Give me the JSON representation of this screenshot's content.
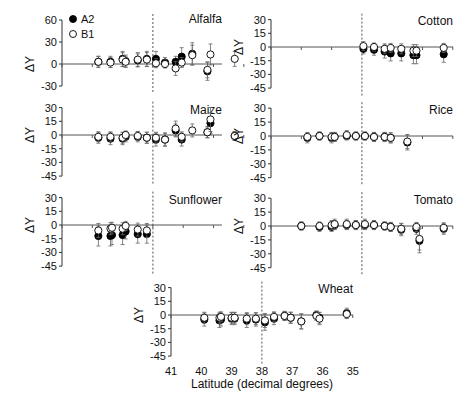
{
  "figure": {
    "xlabel": "Latitude (decimal degrees)",
    "ylabel": "ΔY",
    "x_ticks": [
      "41",
      "40",
      "39",
      "38",
      "37",
      "36",
      "35"
    ],
    "legend": [
      {
        "label": "A2",
        "marker": "filled-circle",
        "color": "#000000"
      },
      {
        "label": "B1",
        "marker": "open-circle",
        "color": "#ffffff"
      }
    ],
    "reference_line_latitude": 38
  },
  "chart_data": {
    "type": "scatter",
    "title": "",
    "xlabel": "Latitude (decimal degrees)",
    "ylabel": "ΔY",
    "xlim": [
      41,
      35
    ],
    "x_inverted": true,
    "grid": false,
    "legend_position": "top-left (Alfalfa panel)",
    "series_names": [
      "A2",
      "B1"
    ],
    "panels": [
      {
        "name": "Alfalfa",
        "yticks": [
          60,
          30,
          0,
          -30
        ],
        "ylim": [
          -30,
          60
        ],
        "A2": [
          [
            39.8,
            3
          ],
          [
            39.4,
            3
          ],
          [
            39.0,
            7
          ],
          [
            38.9,
            4
          ],
          [
            38.5,
            5
          ],
          [
            38.2,
            7
          ],
          [
            37.9,
            7
          ],
          [
            37.6,
            2
          ],
          [
            37.25,
            3
          ],
          [
            37.05,
            10
          ],
          [
            36.7,
            14
          ],
          [
            36.2,
            -10
          ]
        ],
        "B1": [
          [
            39.8,
            3
          ],
          [
            39.4,
            2
          ],
          [
            39.0,
            6
          ],
          [
            38.9,
            3
          ],
          [
            38.5,
            6
          ],
          [
            38.2,
            6
          ],
          [
            37.9,
            1
          ],
          [
            37.6,
            0
          ],
          [
            37.25,
            -6
          ],
          [
            37.05,
            2
          ],
          [
            36.7,
            12
          ],
          [
            36.2,
            -8
          ],
          [
            36.1,
            13
          ],
          [
            35.3,
            7
          ]
        ]
      },
      {
        "name": "Maize",
        "yticks": [
          30,
          15,
          0,
          -15,
          -30,
          -45
        ],
        "ylim": [
          -45,
          30
        ],
        "A2": [
          [
            39.8,
            -3
          ],
          [
            39.4,
            -4
          ],
          [
            39.0,
            -4
          ],
          [
            38.9,
            -2
          ],
          [
            38.5,
            -2
          ],
          [
            38.2,
            -3
          ],
          [
            37.9,
            -5
          ],
          [
            37.6,
            -5
          ],
          [
            37.25,
            5
          ],
          [
            37.05,
            -5
          ],
          [
            36.2,
            3
          ],
          [
            36.1,
            13
          ],
          [
            35.3,
            -1
          ]
        ],
        "B1": [
          [
            39.8,
            -2
          ],
          [
            39.4,
            -2
          ],
          [
            39.0,
            -3
          ],
          [
            38.9,
            0
          ],
          [
            38.5,
            -1
          ],
          [
            38.2,
            -3
          ],
          [
            37.9,
            -3
          ],
          [
            37.6,
            -5
          ],
          [
            37.25,
            7
          ],
          [
            37.05,
            -2
          ],
          [
            36.7,
            5
          ],
          [
            36.2,
            3
          ],
          [
            36.1,
            17
          ],
          [
            35.3,
            -1
          ]
        ]
      },
      {
        "name": "Sunflower",
        "yticks": [
          30,
          15,
          0,
          -15,
          -30,
          -45
        ],
        "ylim": [
          -45,
          30
        ],
        "A2": [
          [
            39.8,
            -12
          ],
          [
            39.4,
            -12
          ],
          [
            39.35,
            -11
          ],
          [
            39.0,
            -11
          ],
          [
            38.9,
            -7
          ],
          [
            38.5,
            -10
          ],
          [
            38.2,
            -10
          ]
        ],
        "B1": [
          [
            39.8,
            -6
          ],
          [
            39.4,
            -4
          ],
          [
            39.35,
            -3
          ],
          [
            39.0,
            -4
          ],
          [
            38.9,
            -1
          ],
          [
            38.5,
            -5
          ],
          [
            38.2,
            -6
          ]
        ]
      },
      {
        "name": "Cotton",
        "yticks": [
          30,
          15,
          0,
          -15,
          -30,
          -45
        ],
        "ylim": [
          -45,
          30
        ],
        "A2": [
          [
            37.95,
            -2
          ],
          [
            37.6,
            -3
          ],
          [
            37.25,
            -5
          ],
          [
            37.05,
            -7
          ],
          [
            36.7,
            -7
          ],
          [
            36.3,
            -9
          ],
          [
            36.2,
            -9
          ],
          [
            35.3,
            -8
          ]
        ],
        "B1": [
          [
            37.95,
            1
          ],
          [
            37.6,
            0
          ],
          [
            37.25,
            -2
          ],
          [
            37.05,
            -1
          ],
          [
            36.7,
            -2
          ],
          [
            36.3,
            -4
          ],
          [
            36.2,
            -4
          ],
          [
            35.3,
            -1
          ]
        ]
      },
      {
        "name": "Rice",
        "yticks": [
          30,
          15,
          0,
          -15,
          -30,
          -45
        ],
        "ylim": [
          -45,
          30
        ],
        "A2": [
          [
            39.8,
            -2
          ],
          [
            39.4,
            0
          ],
          [
            39.0,
            -2
          ],
          [
            38.9,
            -1
          ],
          [
            38.5,
            0
          ],
          [
            38.2,
            0
          ],
          [
            37.9,
            0
          ],
          [
            37.6,
            -1
          ],
          [
            37.25,
            -1
          ],
          [
            37.05,
            -2
          ],
          [
            36.5,
            -7
          ]
        ],
        "B1": [
          [
            39.8,
            -1
          ],
          [
            39.4,
            0
          ],
          [
            39.0,
            -1
          ],
          [
            38.9,
            -1
          ],
          [
            38.5,
            1
          ],
          [
            38.2,
            0
          ],
          [
            37.9,
            0
          ],
          [
            37.6,
            -1
          ],
          [
            37.25,
            -1
          ],
          [
            37.05,
            -2
          ],
          [
            36.5,
            -6
          ]
        ]
      },
      {
        "name": "Tomato",
        "yticks": [
          30,
          15,
          0,
          -15,
          -30,
          -45
        ],
        "ylim": [
          -45,
          30
        ],
        "A2": [
          [
            40.0,
            0
          ],
          [
            39.4,
            -1
          ],
          [
            39.0,
            -1
          ],
          [
            38.9,
            1
          ],
          [
            38.5,
            1
          ],
          [
            38.2,
            1
          ],
          [
            37.9,
            1
          ],
          [
            37.6,
            1
          ],
          [
            37.25,
            0
          ],
          [
            37.05,
            -1
          ],
          [
            36.7,
            -4
          ],
          [
            36.2,
            -3
          ],
          [
            36.1,
            -16
          ],
          [
            35.3,
            -3
          ]
        ],
        "B1": [
          [
            40.0,
            0
          ],
          [
            39.4,
            0
          ],
          [
            39.0,
            1
          ],
          [
            38.9,
            2
          ],
          [
            38.5,
            2
          ],
          [
            38.2,
            1
          ],
          [
            37.9,
            2
          ],
          [
            37.6,
            1
          ],
          [
            37.25,
            0
          ],
          [
            37.05,
            -1
          ],
          [
            36.7,
            -3
          ],
          [
            36.2,
            -1
          ],
          [
            36.1,
            -14
          ],
          [
            35.3,
            -2
          ]
        ]
      },
      {
        "name": "Wheat",
        "yticks": [
          30,
          15,
          0,
          -15,
          -30,
          -45
        ],
        "ylim": [
          -45,
          30
        ],
        "A2": [
          [
            39.9,
            -5
          ],
          [
            39.4,
            -6
          ],
          [
            39.35,
            -5
          ],
          [
            39.0,
            -4
          ],
          [
            38.9,
            -4
          ],
          [
            38.5,
            -6
          ],
          [
            38.2,
            -5
          ],
          [
            37.9,
            -8
          ],
          [
            37.6,
            -4
          ],
          [
            37.25,
            -1
          ],
          [
            37.05,
            -3
          ],
          [
            36.7,
            -7
          ],
          [
            36.2,
            0
          ],
          [
            36.1,
            -3
          ],
          [
            35.2,
            2
          ]
        ],
        "B1": [
          [
            39.9,
            -3
          ],
          [
            39.4,
            -3
          ],
          [
            39.35,
            -2
          ],
          [
            39.0,
            -3
          ],
          [
            38.9,
            -3
          ],
          [
            38.5,
            -4
          ],
          [
            38.2,
            -4
          ],
          [
            37.9,
            -6
          ],
          [
            37.6,
            -2
          ],
          [
            37.25,
            -1
          ],
          [
            37.05,
            -3
          ],
          [
            36.7,
            -7
          ],
          [
            36.2,
            -1
          ],
          [
            36.1,
            -4
          ],
          [
            35.2,
            1
          ]
        ]
      }
    ]
  }
}
